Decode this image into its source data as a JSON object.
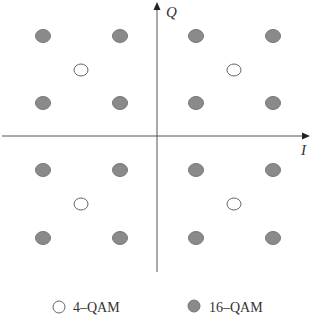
{
  "diagram": {
    "type": "constellation",
    "axes": {
      "x_label": "I",
      "y_label": "Q",
      "origin": [
        157,
        136
      ]
    },
    "colors": {
      "filled": "#8a8a8a",
      "filled_stroke": "#777777",
      "hollow_fill": "#ffffff",
      "hollow_stroke": "#666666",
      "axis": "#555555"
    },
    "points_16qam": [
      [
        43,
        36
      ],
      [
        120,
        36
      ],
      [
        196,
        36
      ],
      [
        273,
        36
      ],
      [
        43,
        103
      ],
      [
        120,
        103
      ],
      [
        196,
        103
      ],
      [
        273,
        103
      ],
      [
        43,
        170
      ],
      [
        120,
        170
      ],
      [
        196,
        170
      ],
      [
        273,
        170
      ],
      [
        43,
        238
      ],
      [
        120,
        238
      ],
      [
        196,
        238
      ],
      [
        273,
        238
      ]
    ],
    "points_4qam": [
      [
        81,
        70
      ],
      [
        234,
        70
      ],
      [
        81,
        204
      ],
      [
        234,
        204
      ]
    ]
  },
  "legend": {
    "items": [
      {
        "label": "4–QAM",
        "marker": "hollow"
      },
      {
        "label": "16–QAM",
        "marker": "filled"
      }
    ]
  }
}
